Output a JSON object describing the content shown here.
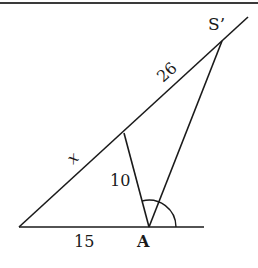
{
  "diagram": {
    "type": "geometry-triangle",
    "labels": {
      "top_point": "S’",
      "hypotenuse_upper": "26",
      "hypotenuse_lower": "x",
      "inner_segment": "10",
      "base_segment": "15",
      "base_point": "A"
    },
    "stroke_color": "#1a1a1a"
  }
}
